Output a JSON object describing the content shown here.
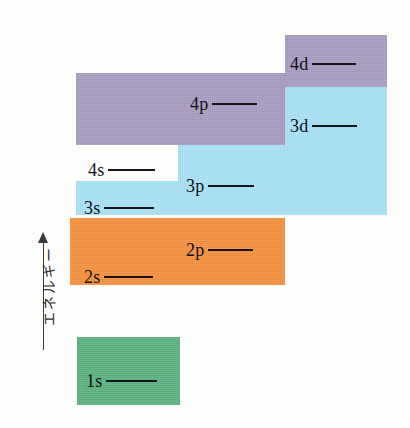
{
  "figure": {
    "kind": "atomic-orbital-energy-level-diagram",
    "background": "#fdfdfb"
  },
  "axis": {
    "label": "エネルギー",
    "direction": "up",
    "arrow_icon": "up-arrow-icon",
    "line_color": "#3a3a3a"
  },
  "colors": {
    "purple": "#a89cc0",
    "cyan": "#a8e2f5",
    "orange": "#f5913e",
    "green": "#5cb280",
    "label": "#101018"
  },
  "bands": [
    {
      "name": "n4-shell-upper-block",
      "color_key": "purple",
      "color": "#a89cc0",
      "x": 285,
      "y": 35,
      "w": 102,
      "h": 52
    },
    {
      "name": "n4-shell-main-block",
      "color_key": "purple",
      "color": "#a89cc0",
      "x": 76,
      "y": 73,
      "w": 209,
      "h": 72
    },
    {
      "name": "n3-shell-right-block",
      "color_key": "cyan",
      "color": "#a8e2f5",
      "x": 285,
      "y": 87,
      "w": 102,
      "h": 128
    },
    {
      "name": "n3-shell-middle-block",
      "color_key": "cyan",
      "color": "#a8e2f5",
      "x": 178,
      "y": 145,
      "w": 107,
      "h": 70
    },
    {
      "name": "n3-shell-left-block",
      "color_key": "cyan",
      "color": "#a8e2f5",
      "x": 76,
      "y": 181,
      "w": 102,
      "h": 34
    },
    {
      "name": "n2-shell-block",
      "color_key": "orange",
      "color": "#f5913e",
      "x": 70,
      "y": 218,
      "w": 215,
      "h": 67
    },
    {
      "name": "n1-shell-block",
      "color_key": "green",
      "color": "#5cb280",
      "x": 77,
      "y": 337,
      "w": 103,
      "h": 68
    }
  ],
  "orbitals": [
    {
      "name": "orbital-4d",
      "label": "4d",
      "x": 290,
      "y": 55,
      "rule_width": 44,
      "shell": 4,
      "subshell": "d"
    },
    {
      "name": "orbital-4p",
      "label": "4p",
      "x": 190,
      "y": 95,
      "rule_width": 45,
      "shell": 4,
      "subshell": "p"
    },
    {
      "name": "orbital-3d",
      "label": "3d",
      "x": 290,
      "y": 117,
      "rule_width": 45,
      "shell": 3,
      "subshell": "d"
    },
    {
      "name": "orbital-4s",
      "label": "4s",
      "x": 88,
      "y": 161,
      "rule_width": 47,
      "shell": 4,
      "subshell": "s"
    },
    {
      "name": "orbital-3p",
      "label": "3p",
      "x": 186,
      "y": 177,
      "rule_width": 46,
      "shell": 3,
      "subshell": "p"
    },
    {
      "name": "orbital-3s",
      "label": "3s",
      "x": 84,
      "y": 199,
      "rule_width": 50,
      "shell": 3,
      "subshell": "s"
    },
    {
      "name": "orbital-2p",
      "label": "2p",
      "x": 186,
      "y": 241,
      "rule_width": 45,
      "shell": 2,
      "subshell": "p"
    },
    {
      "name": "orbital-2s",
      "label": "2s",
      "x": 84,
      "y": 268,
      "rule_width": 49,
      "shell": 2,
      "subshell": "s"
    },
    {
      "name": "orbital-1s",
      "label": "1s",
      "x": 86,
      "y": 372,
      "rule_width": 51,
      "shell": 1,
      "subshell": "s"
    }
  ],
  "chart_data": {
    "type": "diagram",
    "title": "",
    "ylabel": "エネルギー",
    "categories": [
      "1s",
      "2s",
      "2p",
      "3s",
      "3p",
      "4s",
      "3d",
      "4p",
      "4d"
    ],
    "relative_energy_order": [
      1,
      2,
      3,
      4,
      5,
      6,
      7,
      8,
      9
    ],
    "shell_groups": [
      {
        "shell": 1,
        "color": "#5cb280",
        "orbitals": [
          "1s"
        ]
      },
      {
        "shell": 2,
        "color": "#f5913e",
        "orbitals": [
          "2s",
          "2p"
        ]
      },
      {
        "shell": 3,
        "color": "#a8e2f5",
        "orbitals": [
          "3s",
          "3p",
          "3d"
        ]
      },
      {
        "shell": 4,
        "color": "#a89cc0",
        "orbitals": [
          "4s",
          "4p",
          "4d"
        ]
      }
    ]
  }
}
